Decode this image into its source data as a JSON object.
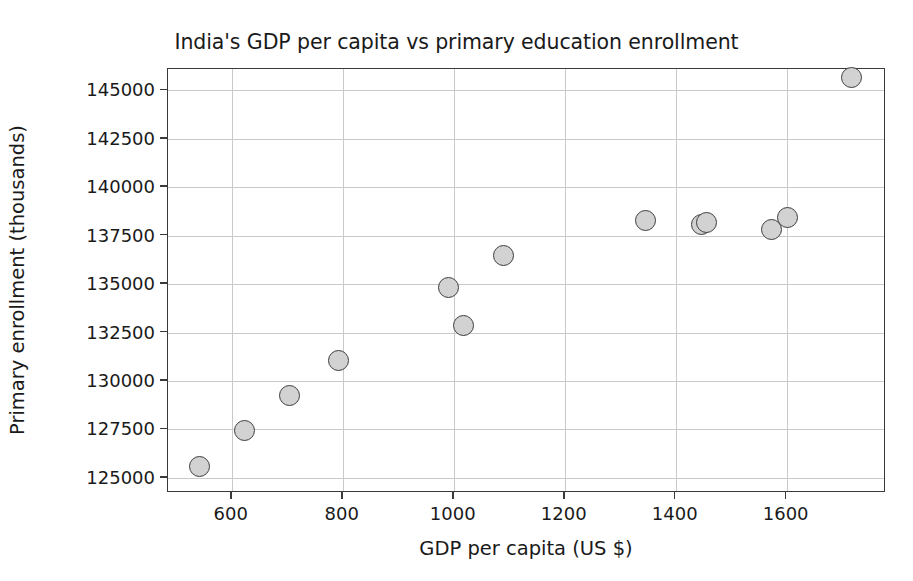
{
  "chart_data": {
    "type": "scatter",
    "title": "India's GDP per capita vs primary education enrollment",
    "xlabel": "GDP per capita (US $)",
    "ylabel": "Primary enrollment (thousands)",
    "xlim": [
      485,
      1779
    ],
    "ylim": [
      124220,
      146100
    ],
    "xticks": [
      600,
      800,
      1000,
      1200,
      1400,
      1600
    ],
    "xtick_labels": [
      "600",
      "800",
      "1000",
      "1200",
      "1400",
      "1600"
    ],
    "yticks": [
      125000,
      127500,
      130000,
      132500,
      135000,
      137500,
      140000,
      142500,
      145000
    ],
    "ytick_labels": [
      "125000",
      "127500",
      "130000",
      "132500",
      "135000",
      "137500",
      "140000",
      "142500",
      "145000"
    ],
    "grid": true,
    "legend": null,
    "marker": {
      "shape": "circle",
      "face_color": "#d2d2d2",
      "edge_color": "#3d3d3d",
      "size_px": 21
    },
    "x": [
      542,
      623,
      704,
      793,
      991,
      1018,
      1090,
      1345,
      1447,
      1456,
      1573,
      1602,
      1717
    ],
    "y": [
      125570,
      127420,
      129230,
      131040,
      134820,
      132870,
      136490,
      138290,
      138080,
      138160,
      137800,
      138450,
      145670
    ],
    "points": [
      {
        "x": 542,
        "y": 125570
      },
      {
        "x": 623,
        "y": 127420
      },
      {
        "x": 704,
        "y": 129230
      },
      {
        "x": 793,
        "y": 131040
      },
      {
        "x": 991,
        "y": 134820
      },
      {
        "x": 1018,
        "y": 132870
      },
      {
        "x": 1090,
        "y": 136490
      },
      {
        "x": 1345,
        "y": 138290
      },
      {
        "x": 1447,
        "y": 138080
      },
      {
        "x": 1456,
        "y": 138160
      },
      {
        "x": 1573,
        "y": 137800
      },
      {
        "x": 1602,
        "y": 138450
      },
      {
        "x": 1717,
        "y": 145670
      }
    ]
  }
}
